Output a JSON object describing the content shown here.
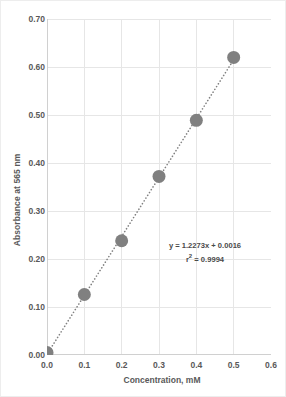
{
  "chart_data": {
    "type": "scatter",
    "title": "",
    "xlabel": "Concentration, mM",
    "ylabel": "Absorbance at 565 nm",
    "xlim": [
      0.0,
      0.6
    ],
    "ylim": [
      0.0,
      0.7
    ],
    "xticks": [
      "0.0",
      "0.1",
      "0.2",
      "0.3",
      "0.4",
      "0.5",
      "0.6"
    ],
    "yticks": [
      "0.00",
      "0.10",
      "0.20",
      "0.30",
      "0.40",
      "0.50",
      "0.60",
      "0.70"
    ],
    "xtick_values": [
      0.0,
      0.1,
      0.2,
      0.3,
      0.4,
      0.5,
      0.6
    ],
    "ytick_values": [
      0.0,
      0.1,
      0.2,
      0.3,
      0.4,
      0.5,
      0.6,
      0.7
    ],
    "grid": true,
    "grid_axes": "both",
    "legend": "none",
    "x": [
      0.0,
      0.1,
      0.2,
      0.3,
      0.4,
      0.5
    ],
    "y": [
      0.005,
      0.126,
      0.238,
      0.372,
      0.489,
      0.62
    ],
    "series": [
      {
        "name": "Standard curve",
        "x": [
          0.0,
          0.1,
          0.2,
          0.3,
          0.4,
          0.5
        ],
        "values": [
          0.005,
          0.126,
          0.238,
          0.372,
          0.489,
          0.62
        ],
        "marker": "circle",
        "marker_color": "#808080",
        "marker_size": 13
      }
    ],
    "trendline": {
      "type": "linear-dotted",
      "slope": 1.2273,
      "intercept": 0.0016,
      "r_squared": 0.9994,
      "color": "#808080",
      "style": "dotted"
    },
    "annotations": {
      "equation": "y = 1.2273x + 0.0016",
      "r_squared_prefix": "r",
      "r_squared_exponent": "2",
      "r_squared_text": " = 0.9994"
    }
  },
  "colors": {
    "marker": "#808080",
    "trendline": "#8c8c8c",
    "grid": "#e6e6e6",
    "axis": "#d0d0d0",
    "text": "#595959",
    "annotation_text": "#4a4a4a",
    "background": "#ffffff",
    "border": "#ededed"
  }
}
